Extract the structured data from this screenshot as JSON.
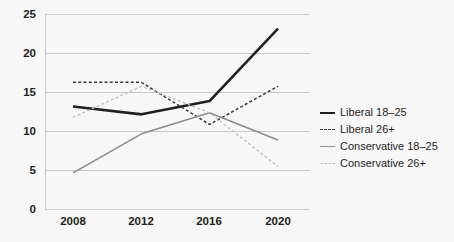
{
  "chart_data": {
    "type": "line",
    "title": "",
    "xlabel": "",
    "ylabel": "",
    "x": [
      2008,
      2012,
      2016,
      2020
    ],
    "xtick_labels": [
      "2008",
      "2012",
      "2016",
      "2020"
    ],
    "ytick_labels": [
      "0",
      "5",
      "10",
      "15",
      "20",
      "25"
    ],
    "ytick_values": [
      0,
      5,
      10,
      15,
      20,
      25
    ],
    "ylim": [
      0,
      25
    ],
    "grid": "horizontal",
    "legend_position": "right",
    "series": [
      {
        "name": "Liberal 18–25",
        "values": [
          13.2,
          12.2,
          13.9,
          23.2
        ],
        "color": "#231f20",
        "style": "solid",
        "width": 2.6
      },
      {
        "name": "Liberal 26+",
        "values": [
          16.3,
          16.3,
          10.9,
          15.8
        ],
        "color": "#3b3b3b",
        "style": "dashed",
        "width": 1.5
      },
      {
        "name": "Conservative 18–25",
        "values": [
          4.7,
          9.7,
          12.4,
          8.9
        ],
        "color": "#8c8c8c",
        "style": "solid",
        "width": 1.6
      },
      {
        "name": "Conservative 26+",
        "values": [
          11.8,
          15.8,
          12.4,
          5.5
        ],
        "color": "#bdbdbd",
        "style": "dotted",
        "width": 1.3
      }
    ]
  },
  "axes": {
    "ytick_0": "0",
    "ytick_5": "5",
    "ytick_10": "10",
    "ytick_15": "15",
    "ytick_20": "20",
    "ytick_25": "25",
    "xtick_2008": "2008",
    "xtick_2012": "2012",
    "xtick_2016": "2016",
    "xtick_2020": "2020"
  },
  "legend": {
    "items": [
      {
        "label": "Liberal 18–25"
      },
      {
        "label": "Liberal 26+"
      },
      {
        "label": "Conservative 18–25"
      },
      {
        "label": "Conservative 26+"
      }
    ]
  },
  "colors": {
    "background": "#f7f7f7",
    "grid": "#c9c9c9",
    "text": "#231f20"
  }
}
